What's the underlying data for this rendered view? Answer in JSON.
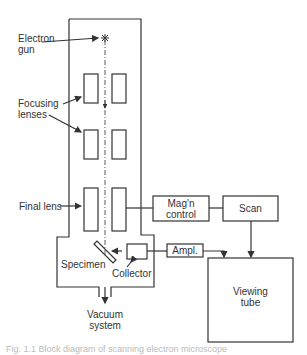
{
  "diagram": {
    "type": "scanning electron microscope block diagram",
    "labels": {
      "electron_gun": [
        "Electron",
        "gun"
      ],
      "focusing_lenses": [
        "Focusing",
        "lenses"
      ],
      "final_lens": "Final lens",
      "specimen": "Specimen",
      "collector": "Collector",
      "vacuum_system": [
        "Vacuum",
        "system"
      ],
      "magn_control": [
        "Mag'n",
        "control"
      ],
      "scan": "Scan",
      "ampl": "Ampl.",
      "viewing_tube": [
        "Viewing",
        "tube"
      ]
    },
    "caption": "Fig. 1.1  Block diagram of scanning electron microscope"
  },
  "colors": {
    "line": "#333333",
    "text": "#333333",
    "background": "#ffffff"
  }
}
